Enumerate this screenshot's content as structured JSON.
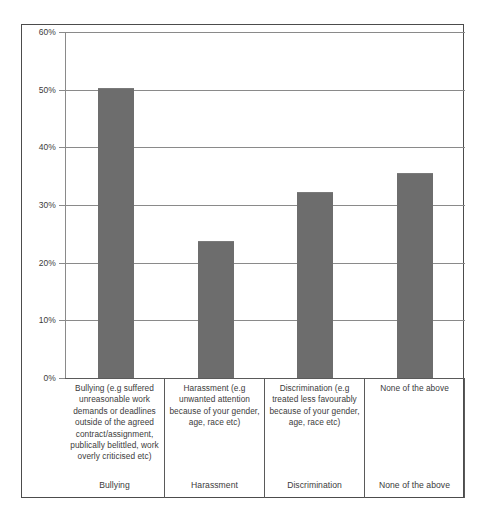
{
  "chart_data": {
    "type": "bar",
    "title": "",
    "subtitle": "",
    "xlabel": "",
    "ylabel": "",
    "grid": true,
    "legend_position": "none",
    "ylim": [
      0,
      60
    ],
    "ytick_labels": [
      "60%",
      "50%",
      "40%",
      "30%",
      "20%",
      "10%",
      "0%"
    ],
    "ytick_values": [
      60,
      50,
      40,
      30,
      20,
      10,
      0
    ],
    "categories": [
      "Bullying",
      "Harassment",
      "Discrimination",
      "None of the above"
    ],
    "values": [
      50.3,
      23.8,
      32.3,
      35.6
    ],
    "value_labels": [
      "50.3%",
      "23.8%",
      "32.3%",
      "35.6%"
    ],
    "bar_color": "#6d6d6d",
    "axis_color": "#8a8a8a",
    "frame_color": "#4c4c4c",
    "descriptions": [
      "Bullying (e.g suffered unreasonable  work demands  or deadlines outside of the agreed contract/assignment, publically belittled, work overly criticised etc)",
      "Harassment (e.g unwanted  attention because of your gender, age, race etc)",
      "Discrimination (e.g treated less favourably because of your gender, age,  race etc)",
      "None of the above"
    ]
  },
  "y_axis": {
    "ticks": [
      {
        "label": "60%",
        "value": 60
      },
      {
        "label": "50%",
        "value": 50
      },
      {
        "label": "40%",
        "value": 40
      },
      {
        "label": "30%",
        "value": 30
      },
      {
        "label": "20%",
        "value": 20
      },
      {
        "label": "10%",
        "value": 10
      },
      {
        "label": "0%",
        "value": 0
      }
    ]
  },
  "columns": [
    {
      "description": "Bullying (e.g suffered unreasonable  work demands  or deadlines outside of the agreed contract/assignment, publically belittled, work overly criticised etc)",
      "category": "Bullying",
      "value": 50.3
    },
    {
      "description": "Harassment (e.g unwanted  attention because of your gender, age, race etc)",
      "category": "Harassment",
      "value": 23.8
    },
    {
      "description": "Discrimination (e.g treated less favourably because of your gender, age,  race etc)",
      "category": "Discrimination",
      "value": 32.3
    },
    {
      "description": "None of the above",
      "category": "None of the above",
      "value": 35.6
    }
  ]
}
